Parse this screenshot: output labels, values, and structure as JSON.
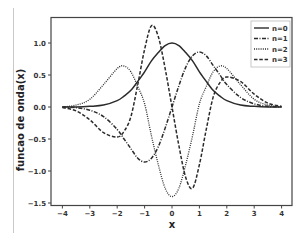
{
  "chart_data": {
    "type": "line",
    "title": "",
    "xlabel": "x",
    "ylabel": "funcao de onda(x)",
    "xlim": [
      -4.4,
      4.4
    ],
    "ylim": [
      -1.53,
      1.41
    ],
    "xticks": [
      -4,
      -3,
      -2,
      -1,
      0,
      1,
      2,
      3,
      4
    ],
    "yticks": [
      -1.5,
      -1.0,
      -0.5,
      0.0,
      0.5,
      1.0
    ],
    "xtick_labels": [
      "−4",
      "−3",
      "−2",
      "−1",
      "0",
      "1",
      "2",
      "3",
      "4"
    ],
    "ytick_labels": [
      "−1.5",
      "−1.0",
      "−0.5",
      "0.0",
      "0.5",
      "1.0"
    ],
    "grid": false,
    "legend_position": "upper right",
    "x": [
      -4,
      -3.5,
      -3,
      -2.5,
      -2,
      -1.75,
      -1.5,
      -1.25,
      -1,
      -0.75,
      -0.5,
      -0.25,
      0,
      0.25,
      0.5,
      0.75,
      1,
      1.25,
      1.5,
      1.75,
      2,
      2.5,
      3,
      3.5,
      4
    ],
    "series": [
      {
        "name": "n=0",
        "style": "solid",
        "values": [
          0.0,
          0.0,
          0.01,
          0.03,
          0.1,
          0.17,
          0.26,
          0.4,
          0.55,
          0.72,
          0.85,
          0.96,
          1.0,
          0.96,
          0.85,
          0.72,
          0.55,
          0.4,
          0.26,
          0.17,
          0.1,
          0.03,
          0.01,
          0.0,
          0.0
        ]
      },
      {
        "name": "n=1",
        "style": "dashdot",
        "values": [
          0.0,
          -0.01,
          -0.05,
          -0.15,
          -0.35,
          -0.5,
          -0.65,
          -0.8,
          -0.86,
          -0.8,
          -0.62,
          -0.33,
          0.0,
          0.33,
          0.62,
          0.8,
          0.86,
          0.8,
          0.65,
          0.5,
          0.35,
          0.15,
          0.05,
          0.01,
          0.0
        ]
      },
      {
        "name": "n=2",
        "style": "dotted",
        "values": [
          0.0,
          0.03,
          0.12,
          0.35,
          0.6,
          0.64,
          0.55,
          0.32,
          0.05,
          -0.45,
          -0.9,
          -1.27,
          -1.4,
          -1.27,
          -0.9,
          -0.45,
          0.05,
          0.32,
          0.55,
          0.64,
          0.6,
          0.35,
          0.12,
          0.03,
          0.0
        ]
      },
      {
        "name": "n=3",
        "style": "dashed",
        "values": [
          -0.01,
          -0.06,
          -0.2,
          -0.4,
          -0.47,
          -0.38,
          -0.15,
          0.35,
          0.9,
          1.27,
          1.1,
          0.6,
          0.0,
          -0.6,
          -1.1,
          -1.27,
          -0.9,
          -0.35,
          0.15,
          0.38,
          0.47,
          0.4,
          0.2,
          0.06,
          0.01
        ]
      }
    ]
  },
  "axes": {
    "xlabel": "x",
    "ylabel": "funcao de onda(x)"
  },
  "legend": {
    "items": [
      {
        "label": "n=0",
        "style": "solid"
      },
      {
        "label": "n=1",
        "style": "dashdot"
      },
      {
        "label": "n=2",
        "style": "dotted"
      },
      {
        "label": "n=3",
        "style": "dashed"
      }
    ]
  },
  "colors": {
    "line": "#2b2b2b",
    "axis": "#444444",
    "legend_border": "#bbbbbb"
  }
}
